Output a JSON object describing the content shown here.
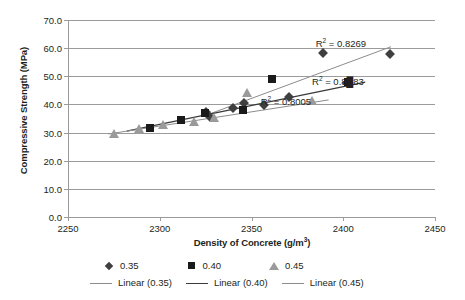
{
  "chart_data": {
    "type": "scatter",
    "title": "",
    "xlabel": "Density of Concrete (g/m3)",
    "xlabel_base": "Density of Concrete (g/m",
    "xlabel_sup": "3",
    "xlabel_tail": ")",
    "ylabel": "Compressive Strength (MPa)",
    "xlim": [
      2250,
      2450
    ],
    "ylim": [
      0,
      70
    ],
    "xticks": [
      2250,
      2300,
      2350,
      2400,
      2450
    ],
    "xtick_labels": [
      "2250",
      "2300",
      "2350",
      "2400",
      "2450"
    ],
    "yticks": [
      0,
      10,
      20,
      30,
      40,
      50,
      60,
      70
    ],
    "ytick_labels": [
      "0.0",
      "10.0",
      "20.0",
      "30.0",
      "40.0",
      "50.0",
      "60.0",
      "70.0"
    ],
    "grid": "horizontal",
    "legend_position": "bottom",
    "series": [
      {
        "name": "0.35",
        "marker": "diamond",
        "color": "#3f3f3f",
        "points": [
          [
            2325.0,
            37.2
          ],
          [
            2327.5,
            35.4
          ],
          [
            2340.0,
            38.6
          ],
          [
            2346.0,
            40.4
          ],
          [
            2357.0,
            39.7
          ],
          [
            2370.5,
            42.6
          ],
          [
            2389.0,
            58.4
          ],
          [
            2402.0,
            47.6
          ],
          [
            2425.5,
            57.8
          ]
        ]
      },
      {
        "name": "0.40",
        "marker": "square",
        "color": "#1a1a1a",
        "points": [
          [
            2294.5,
            31.6
          ],
          [
            2311.5,
            34.3
          ],
          [
            2324.5,
            37.0
          ],
          [
            2345.5,
            38.0
          ],
          [
            2361.0,
            48.9
          ],
          [
            2402.5,
            47.8
          ]
        ]
      },
      {
        "name": "0.45",
        "marker": "triangle",
        "color": "#9a9a9a",
        "points": [
          [
            2275.0,
            29.6
          ],
          [
            2288.5,
            31.1
          ],
          [
            2301.5,
            32.6
          ],
          [
            2318.5,
            33.9
          ],
          [
            2329.5,
            35.3
          ],
          [
            2347.5,
            44.0
          ],
          [
            2383.0,
            41.3
          ]
        ]
      }
    ],
    "trendlines": [
      {
        "name": "Linear (0.35)",
        "color": "#8c8c8c",
        "x0": 2325.0,
        "y0": 36.1,
        "x1": 2426.0,
        "y1": 60.5,
        "r2_label": "R² = 0.8269",
        "r2_value": 0.8269
      },
      {
        "name": "Linear (0.40)",
        "color": "#3a3a3a",
        "x0": 2282.0,
        "y0": 30.5,
        "x1": 2412.0,
        "y1": 47.9,
        "r2_label": "R² = 0.8?83",
        "r2_value": null
      },
      {
        "name": "Linear (0.45)",
        "color": "#8c8c8c",
        "x0": 2272.0,
        "y0": 29.5,
        "x1": 2392.0,
        "y1": 41.6,
        "r2_label": "R² = 0.8005",
        "r2_value": 0.8005
      }
    ],
    "annotations": [
      {
        "text": "R² = 0.8269",
        "x": 2385.0,
        "y": 61.5,
        "name": "r2-annotation-035"
      },
      {
        "text": "R² = 0.8█83",
        "x": 2383.0,
        "y": 47.9,
        "name": "r2-annotation-040"
      },
      {
        "text": "R² = 0.8005",
        "x": 2355.0,
        "y": 41.0,
        "name": "r2-annotation-045"
      }
    ],
    "legend": {
      "markers": [
        {
          "label": "0.35",
          "marker": "diamond"
        },
        {
          "label": "0.40",
          "marker": "square"
        },
        {
          "label": "0.45",
          "marker": "triangle"
        }
      ],
      "lines": [
        {
          "label": "Linear (0.35)"
        },
        {
          "label": "Linear (0.40)"
        },
        {
          "label": "Linear (0.45)"
        }
      ]
    },
    "colors": {
      "gridline": "#9b9b9b",
      "axis": "#9b9b9b",
      "text": "#231f20",
      "series_035": "#3f3f3f",
      "series_040": "#1a1a1a",
      "series_045": "#9a9a9a",
      "trend_light": "#8c8c8c",
      "trend_dark": "#3a3a3a"
    }
  }
}
